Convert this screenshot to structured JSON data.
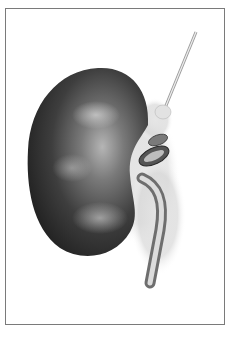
{
  "figure": {
    "style": "grayscale medical illustration",
    "parts": [
      "kidney",
      "renal vessels",
      "ureter",
      "fat tissue",
      "adrenal vessel"
    ],
    "colors": {
      "frame_border": "#7a7a7a",
      "kidney_dark": "#2a2a2a",
      "kidney_mid": "#555555",
      "kidney_light": "#9a9a9a",
      "background": "#ffffff"
    }
  }
}
